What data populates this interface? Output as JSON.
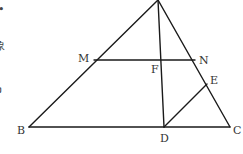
{
  "diagram": {
    "type": "geometry-triangle",
    "points": {
      "A": {
        "x": 158,
        "y": 0,
        "label": ""
      },
      "B": {
        "x": 29,
        "y": 127,
        "label": "B"
      },
      "C": {
        "x": 230,
        "y": 127,
        "label": "C"
      },
      "D": {
        "x": 164,
        "y": 127,
        "label": "D"
      },
      "E": {
        "x": 207,
        "y": 84,
        "label": "E"
      },
      "F": {
        "x": 161,
        "y": 60,
        "label": "F"
      },
      "M": {
        "x": 94,
        "y": 60,
        "label": "M"
      },
      "N": {
        "x": 195,
        "y": 60,
        "label": "N"
      }
    },
    "segments": [
      [
        "A",
        "B"
      ],
      [
        "A",
        "C"
      ],
      [
        "B",
        "C"
      ],
      [
        "M",
        "N"
      ],
      [
        "A",
        "D"
      ],
      [
        "D",
        "E"
      ]
    ],
    "edge_text": [
      {
        "text": "•",
        "x": 0,
        "y": 13
      },
      {
        "text": "象",
        "x": 0,
        "y": 47
      },
      {
        "text": "ວ",
        "x": 0,
        "y": 92
      }
    ]
  }
}
